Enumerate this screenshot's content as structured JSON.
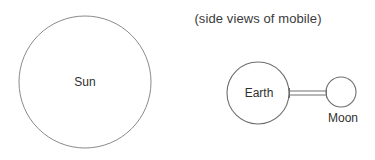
{
  "caption": {
    "text": "(side views of mobile)"
  },
  "diagram": {
    "background_color": "#ffffff",
    "stroke_color": "#8a8a8a",
    "text_color": "#2f2f2f",
    "bodies": [
      {
        "id": "sun",
        "label": "Sun",
        "shape": "circle",
        "cx": 85,
        "cy": 82,
        "r": 66
      },
      {
        "id": "earth",
        "label": "Earth",
        "shape": "circle",
        "cx": 258,
        "cy": 93,
        "r": 31
      },
      {
        "id": "moon",
        "label": "Moon",
        "shape": "circle",
        "cx": 341,
        "cy": 92,
        "r": 15
      }
    ],
    "connector": {
      "id": "earth-moon-rod",
      "style": "double-line-rod",
      "x1": 289,
      "x2": 327,
      "y": 93,
      "thickness": 4
    }
  }
}
